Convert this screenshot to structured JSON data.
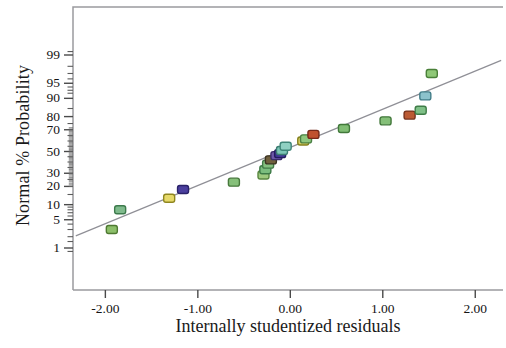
{
  "chart_data": {
    "type": "scatter",
    "title": "",
    "subtitle": "",
    "xlabel": "Internally studentized residuals",
    "ylabel": "Normal % Probability",
    "xlim": [
      -2.35,
      2.3
    ],
    "ylim_percent": [
      0.6,
      99.6
    ],
    "grid": false,
    "legend": "none",
    "x_ticks": [
      "-2.00",
      "-1.00",
      "0.00",
      "1.00",
      "2.00"
    ],
    "x_tick_values": [
      -2,
      -1,
      0,
      1,
      2
    ],
    "y_ticks": [
      "99",
      "95",
      "90",
      "80",
      "70",
      "50",
      "30",
      "20",
      "10",
      "5",
      "1"
    ],
    "y_tick_values": [
      99,
      95,
      90,
      80,
      70,
      50,
      30,
      20,
      10,
      5,
      1
    ],
    "reference_line": {
      "name": "normal-reference-line",
      "color": "#8f8f96",
      "x_from": -2.32,
      "x_to": 2.28,
      "p_from": 2.1,
      "p_to": 98.6
    },
    "marker": {
      "shape": "rounded-rect",
      "width": 11,
      "height": 8,
      "stroke_width": 1.4
    },
    "series": [
      {
        "name": "Design points",
        "points": [
          {
            "x": -1.93,
            "p": 3.0,
            "color": "#8cbf6a",
            "stroke": "#4f7a33"
          },
          {
            "x": -1.84,
            "p": 8.0,
            "color": "#7fba8c",
            "stroke": "#3d7a4c"
          },
          {
            "x": -1.31,
            "p": 13.0,
            "color": "#e6d96a",
            "stroke": "#8f861f"
          },
          {
            "x": -1.16,
            "p": 18.0,
            "color": "#4b3f9e",
            "stroke": "#2a2269"
          },
          {
            "x": -0.61,
            "p": 23.0,
            "color": "#86c07a",
            "stroke": "#47783c"
          },
          {
            "x": -0.29,
            "p": 28.5,
            "color": "#9ec97e",
            "stroke": "#5a8740"
          },
          {
            "x": -0.27,
            "p": 33.0,
            "color": "#7bbd7e",
            "stroke": "#3d7a46"
          },
          {
            "x": -0.24,
            "p": 38.0,
            "color": "#84c07f",
            "stroke": "#427b47"
          },
          {
            "x": -0.21,
            "p": 42.0,
            "color": "#6f5f3c",
            "stroke": "#3c3320"
          },
          {
            "x": -0.15,
            "p": 46.0,
            "color": "#6d57a8",
            "stroke": "#3b2d6b"
          },
          {
            "x": -0.11,
            "p": 48.0,
            "color": "#3f3594",
            "stroke": "#231c5e"
          },
          {
            "x": -0.09,
            "p": 51.0,
            "color": "#7cc5b6",
            "stroke": "#3c7d72"
          },
          {
            "x": -0.05,
            "p": 55.0,
            "color": "#8fd0c2",
            "stroke": "#3f8578"
          },
          {
            "x": 0.14,
            "p": 60.0,
            "color": "#d9d063",
            "stroke": "#85801c"
          },
          {
            "x": 0.17,
            "p": 62.0,
            "color": "#8fc77f",
            "stroke": "#4a8044"
          },
          {
            "x": 0.25,
            "p": 66.0,
            "color": "#c0512f",
            "stroke": "#76291a"
          },
          {
            "x": 0.58,
            "p": 71.0,
            "color": "#81bd74",
            "stroke": "#41793a"
          },
          {
            "x": 1.03,
            "p": 77.0,
            "color": "#84bf78",
            "stroke": "#43793c"
          },
          {
            "x": 1.29,
            "p": 81.0,
            "color": "#bb5a33",
            "stroke": "#76321c"
          },
          {
            "x": 1.41,
            "p": 84.0,
            "color": "#7fc087",
            "stroke": "#3f7c48"
          },
          {
            "x": 1.46,
            "p": 91.0,
            "color": "#8cc2cc",
            "stroke": "#427d88"
          },
          {
            "x": 1.53,
            "p": 97.0,
            "color": "#8fc877",
            "stroke": "#4a8039"
          }
        ]
      }
    ]
  }
}
